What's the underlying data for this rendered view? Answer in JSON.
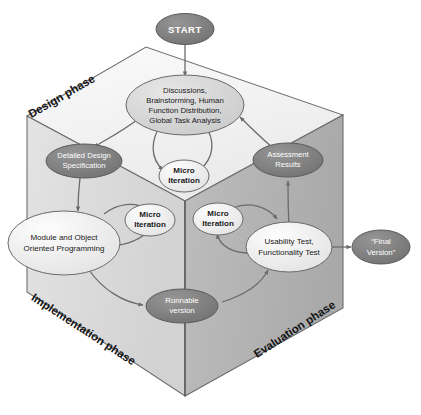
{
  "diagram": {
    "colors": {
      "face_top": "#f2f2f2",
      "face_left": "#dcdcdc",
      "face_right": "#b4b4b4",
      "edge": "#5a5a5a",
      "node_dark": "#7d7d7d",
      "node_light": "#e8e8e8",
      "node_mid": "#d2d2d2",
      "arrow": "#6b6b6b",
      "text_dark": "#1a1a1a",
      "text_light": "#ffffff"
    },
    "phases": [
      {
        "id": "design",
        "label": "Design phase"
      },
      {
        "id": "implementation",
        "label": "Implementation phase"
      },
      {
        "id": "evaluation",
        "label": "Evaluation phase"
      }
    ],
    "nodes": [
      {
        "id": "start",
        "label": "START",
        "style": "dark",
        "lines": [
          "START"
        ]
      },
      {
        "id": "discussions",
        "label": "Discussions, Brainstorming, Human Function Distribution, Global Task Analysis",
        "style": "mid",
        "lines": [
          "Discussions,",
          "Brainstorming, Human",
          "Function Distribution,",
          "Global Task Analysis"
        ]
      },
      {
        "id": "detailed-design",
        "label": "Detailed Design Specification",
        "style": "dark",
        "lines": [
          "Detailed Design",
          "Specification"
        ]
      },
      {
        "id": "assessment-results",
        "label": "Assessment Results",
        "style": "dark",
        "lines": [
          "Assessment",
          "Results"
        ]
      },
      {
        "id": "micro-iteration-design",
        "label": "Micro Iteration",
        "style": "light",
        "lines": [
          "Micro",
          "Iteration"
        ]
      },
      {
        "id": "micro-iteration-implementation",
        "label": "Micro Iteration",
        "style": "light",
        "lines": [
          "Micro",
          "Iteration"
        ]
      },
      {
        "id": "micro-iteration-evaluation",
        "label": "Micro Iteration",
        "style": "light",
        "lines": [
          "Micro",
          "Iteration"
        ]
      },
      {
        "id": "module-programming",
        "label": "Module and Object Oriented Programming",
        "style": "light",
        "lines": [
          "Module and Object",
          "Oriented Programming"
        ]
      },
      {
        "id": "usability-test",
        "label": "Usability Test, Functionality Test",
        "style": "light",
        "lines": [
          "Usability Test,",
          "Functionality Test"
        ]
      },
      {
        "id": "runnable-version",
        "label": "Runnable version",
        "style": "dark",
        "lines": [
          "Runnable",
          "version"
        ]
      },
      {
        "id": "final-version",
        "label": "“Final Version”",
        "style": "dark",
        "lines": [
          "“Final",
          "Version”"
        ]
      }
    ],
    "edges": [
      {
        "from": "start",
        "to": "discussions"
      },
      {
        "from": "discussions",
        "to": "detailed-design"
      },
      {
        "from": "discussions",
        "to": "micro-iteration-design"
      },
      {
        "from": "micro-iteration-design",
        "to": "discussions"
      },
      {
        "from": "detailed-design",
        "to": "module-programming"
      },
      {
        "from": "module-programming",
        "to": "micro-iteration-implementation"
      },
      {
        "from": "micro-iteration-implementation",
        "to": "module-programming"
      },
      {
        "from": "module-programming",
        "to": "runnable-version"
      },
      {
        "from": "runnable-version",
        "to": "usability-test"
      },
      {
        "from": "usability-test",
        "to": "micro-iteration-evaluation"
      },
      {
        "from": "micro-iteration-evaluation",
        "to": "usability-test"
      },
      {
        "from": "usability-test",
        "to": "assessment-results"
      },
      {
        "from": "assessment-results",
        "to": "discussions"
      },
      {
        "from": "usability-test",
        "to": "final-version"
      }
    ]
  }
}
